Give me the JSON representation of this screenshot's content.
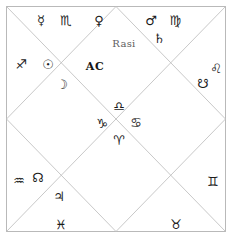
{
  "chart": {
    "title": "Rasi",
    "ascendant_label": "AC",
    "style": "north-indian-diamond",
    "border_color": "#b9b9b9",
    "line_color": "#c2c2c2",
    "glyph_color": "#1b1b1b",
    "title_color": "#5d5d5d",
    "background": "#ffffff"
  },
  "glyphs": {
    "mercury": "☿",
    "scorpio": "♏",
    "venus": "♀",
    "mars": "♂",
    "virgo": "♍",
    "saturn": "♄",
    "sagittarius": "♐",
    "sun": "☉",
    "moon": "☽",
    "leo": "♌",
    "ketu": "☋",
    "libra": "♎",
    "capricorn": "♑",
    "cancer": "♋",
    "aries": "♈",
    "aquarius": "♒",
    "rahu": "☊",
    "jupiter": "♃",
    "pisces": "♓",
    "taurus": "♉",
    "gemini": "♊"
  },
  "placements": [
    {
      "id": "mercury",
      "name": "mercury-glyph",
      "kind": "planet",
      "symbol": "☿",
      "x": 41,
      "y": 20
    },
    {
      "id": "scorpio",
      "name": "scorpio-glyph",
      "kind": "sign",
      "symbol": "♏",
      "x": 66,
      "y": 20
    },
    {
      "id": "venus",
      "name": "venus-glyph",
      "kind": "planet",
      "symbol": "♀",
      "x": 99,
      "y": 20
    },
    {
      "id": "mars",
      "name": "mars-glyph",
      "kind": "planet",
      "symbol": "♂",
      "x": 151,
      "y": 20
    },
    {
      "id": "virgo",
      "name": "virgo-glyph",
      "kind": "sign",
      "symbol": "♍",
      "x": 175,
      "y": 20
    },
    {
      "id": "saturn",
      "name": "saturn-glyph",
      "kind": "planet",
      "symbol": "♄",
      "x": 159,
      "y": 38
    },
    {
      "id": "rasi-title",
      "name": "chart-title",
      "kind": "title",
      "symbol": "Rasi",
      "x": 124,
      "y": 44
    },
    {
      "id": "sagittarius",
      "name": "sagittarius-glyph",
      "kind": "sign",
      "symbol": "♐",
      "x": 21,
      "y": 64
    },
    {
      "id": "sun",
      "name": "sun-glyph",
      "kind": "planet",
      "symbol": "☉",
      "x": 48,
      "y": 64
    },
    {
      "id": "ac",
      "name": "ascendant-label",
      "kind": "ac",
      "symbol": "AC",
      "x": 95,
      "y": 66
    },
    {
      "id": "moon",
      "name": "moon-glyph",
      "kind": "planet",
      "symbol": "☽",
      "x": 62,
      "y": 84
    },
    {
      "id": "leo",
      "name": "leo-glyph",
      "kind": "sign",
      "symbol": "♌",
      "x": 216,
      "y": 68
    },
    {
      "id": "ketu",
      "name": "ketu-glyph",
      "kind": "node",
      "symbol": "☋",
      "x": 203,
      "y": 83
    },
    {
      "id": "libra",
      "name": "libra-glyph",
      "kind": "sign",
      "symbol": "♎",
      "x": 119,
      "y": 106
    },
    {
      "id": "capricorn",
      "name": "capricorn-glyph",
      "kind": "sign",
      "symbol": "♑",
      "x": 102,
      "y": 123
    },
    {
      "id": "cancer",
      "name": "cancer-glyph",
      "kind": "sign",
      "symbol": "♋",
      "x": 136,
      "y": 122
    },
    {
      "id": "aries",
      "name": "aries-glyph",
      "kind": "sign",
      "symbol": "♈",
      "x": 119,
      "y": 140
    },
    {
      "id": "aquarius",
      "name": "aquarius-glyph",
      "kind": "sign",
      "symbol": "♒",
      "x": 19,
      "y": 180
    },
    {
      "id": "rahu",
      "name": "rahu-glyph",
      "kind": "node",
      "symbol": "☊",
      "x": 38,
      "y": 177
    },
    {
      "id": "jupiter",
      "name": "jupiter-glyph",
      "kind": "planet",
      "symbol": "♃",
      "x": 59,
      "y": 196
    },
    {
      "id": "gemini",
      "name": "gemini-glyph",
      "kind": "sign",
      "symbol": "♊",
      "x": 213,
      "y": 181
    },
    {
      "id": "pisces",
      "name": "pisces-glyph",
      "kind": "sign",
      "symbol": "♓",
      "x": 61,
      "y": 224
    },
    {
      "id": "taurus",
      "name": "taurus-glyph",
      "kind": "sign",
      "symbol": "♉",
      "x": 176,
      "y": 224
    }
  ],
  "chart_data": {
    "type": "table",
    "title": "Rasi",
    "ascendant": "AC",
    "houses": [
      {
        "house": 1,
        "position": "center-top",
        "sign": "Libra",
        "sign_symbol": "♎",
        "planets": []
      },
      {
        "house": 2,
        "position": "top-left-inner",
        "sign": "Scorpio",
        "sign_symbol": "♏",
        "planets": [
          "Mercury",
          "Venus"
        ]
      },
      {
        "house": 3,
        "position": "top-left-corner",
        "sign": "Sagittarius",
        "sign_symbol": "♐",
        "planets": [
          "Sun",
          "Moon"
        ]
      },
      {
        "house": 4,
        "position": "center-left",
        "sign": "Capricorn",
        "sign_symbol": "♑",
        "planets": []
      },
      {
        "house": 5,
        "position": "left",
        "sign": "Aquarius",
        "sign_symbol": "♒",
        "planets": [
          "Rahu",
          "Jupiter"
        ]
      },
      {
        "house": 6,
        "position": "bottom-left",
        "sign": "Pisces",
        "sign_symbol": "♓",
        "planets": []
      },
      {
        "house": 7,
        "position": "center-bottom",
        "sign": "Aries",
        "sign_symbol": "♈",
        "planets": []
      },
      {
        "house": 8,
        "position": "bottom-right",
        "sign": "Taurus",
        "sign_symbol": "♉",
        "planets": []
      },
      {
        "house": 9,
        "position": "right-lower",
        "sign": "Gemini",
        "sign_symbol": "♊",
        "planets": []
      },
      {
        "house": 10,
        "position": "center-right",
        "sign": "Cancer",
        "sign_symbol": "♋",
        "planets": []
      },
      {
        "house": 11,
        "position": "right-upper",
        "sign": "Leo",
        "sign_symbol": "♌",
        "planets": [
          "Ketu"
        ]
      },
      {
        "house": 12,
        "position": "top-right",
        "sign": "Virgo",
        "sign_symbol": "♍",
        "planets": [
          "Mars",
          "Saturn"
        ]
      }
    ],
    "planet_symbols": {
      "Sun": "☉",
      "Moon": "☽",
      "Mars": "♂",
      "Mercury": "☿",
      "Jupiter": "♃",
      "Venus": "♀",
      "Saturn": "♄",
      "Rahu": "☊",
      "Ketu": "☋"
    }
  },
  "caption": {
    "fragment": ""
  }
}
